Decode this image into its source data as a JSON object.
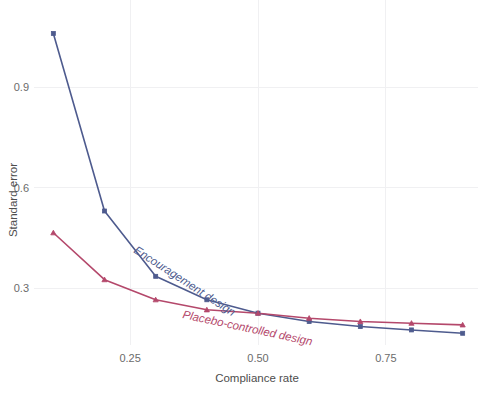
{
  "chart_data": {
    "type": "line",
    "title": "",
    "xlabel": "Compliance rate",
    "ylabel": "Standard error",
    "xlim": [
      0.07,
      0.93
    ],
    "ylim": [
      0.13,
      1.13
    ],
    "xticks": [
      0.25,
      0.5,
      0.75
    ],
    "xtick_labels": [
      "0.25",
      "0.50",
      "0.75"
    ],
    "yticks": [
      0.3,
      0.6,
      0.9
    ],
    "ytick_labels": [
      "0.3",
      "0.6",
      "0.9"
    ],
    "grid": "both-light",
    "legend_position": "inline-annotations",
    "x": [
      0.1,
      0.2,
      0.3,
      0.4,
      0.5,
      0.6,
      0.7,
      0.8,
      0.9
    ],
    "series": [
      {
        "name": "Encouragement design",
        "color": "#4e5b8e",
        "marker": "square",
        "annotation": "Encouragement design",
        "annotation_rotation": 33,
        "values": [
          1.06,
          0.53,
          0.335,
          0.265,
          0.225,
          0.2,
          0.185,
          0.175,
          0.165
        ]
      },
      {
        "name": "Placebo-controlled design",
        "color": "#b4486b",
        "marker": "triangle",
        "annotation": "Placebo-controlled design",
        "annotation_rotation": 12,
        "values": [
          0.465,
          0.325,
          0.265,
          0.235,
          0.225,
          0.21,
          0.2,
          0.195,
          0.19
        ]
      }
    ]
  },
  "colors": {
    "encouragement": "#4e5b8e",
    "placebo": "#b4486b",
    "grid": "#f0f0f2",
    "text": "#5a5a5a",
    "background": "#ffffff"
  }
}
